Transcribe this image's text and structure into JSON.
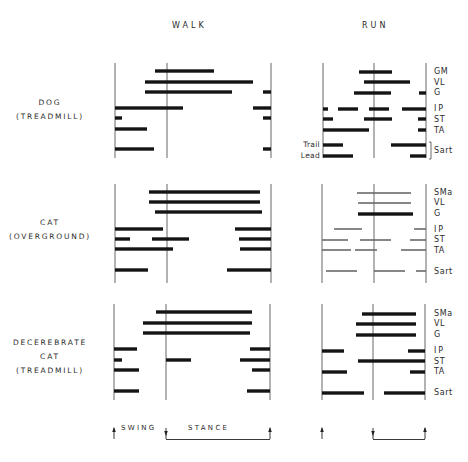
{
  "columns": {
    "walk": "WALK",
    "run": "RUN"
  },
  "groups": [
    {
      "line1": "DOG",
      "line2": "(TREADMILL)",
      "line3": ""
    },
    {
      "line1": "CAT",
      "line2": "(OVERGROUND)",
      "line3": ""
    },
    {
      "line1": "DECEREBRATE",
      "line2": "CAT",
      "line3": "(TREADMILL)"
    }
  ],
  "muscles": {
    "dog": [
      "GM",
      "VL",
      "G",
      "IP",
      "ST",
      "TA",
      "Sart"
    ],
    "cat": [
      "SMa",
      "VL",
      "G",
      "IP",
      "ST",
      "TA",
      "Sart"
    ],
    "decerebrate_cat": [
      "SMa",
      "VL",
      "G",
      "IP",
      "ST",
      "TA",
      "Sart"
    ]
  },
  "sart_sublabels": {
    "trail": "Trail",
    "lead": "Lead"
  },
  "legend": {
    "swing": "SWING",
    "stance": "STANCE"
  },
  "colors": {
    "bar": "#141414",
    "thin_bar": "#6a6a6a",
    "axis": "#555555"
  },
  "chart_data": {
    "type": "timing",
    "title": "",
    "xlabel": "Step cycle (swing | stance)",
    "columns": [
      "WALK",
      "RUN"
    ],
    "note": "Bars show EMG burst timing within one step cycle. x positions in pixels; walk panel axis lines at x=115 (swing onset), 167 (stance onset/foot contact), 271 (next swing onset); run panel at 323, 374, 426.",
    "panels": [
      {
        "group": "DOG (TREADMILL)",
        "gait": "WALK",
        "axes": {
          "x": [
            115,
            167,
            271
          ],
          "y": [
            63,
            158
          ]
        },
        "rows": [
          {
            "muscle": "GM",
            "y": 71,
            "bars": [
              [
                155,
                214
              ]
            ]
          },
          {
            "muscle": "VL",
            "y": 82,
            "bars": [
              [
                145,
                253
              ]
            ]
          },
          {
            "muscle": "G",
            "y": 92,
            "bars": [
              [
                145,
                232
              ],
              [
                263,
                271
              ]
            ]
          },
          {
            "muscle": "IP",
            "y": 108,
            "bars": [
              [
                115,
                183
              ],
              [
                253,
                271
              ]
            ]
          },
          {
            "muscle": "ST",
            "y": 118,
            "bars": [
              [
                115,
                122
              ],
              [
                263,
                271
              ]
            ]
          },
          {
            "muscle": "TA",
            "y": 129,
            "bars": [
              [
                115,
                147
              ]
            ]
          },
          {
            "muscle": "Sart",
            "y": 149,
            "bars": [
              [
                115,
                154
              ],
              [
                263,
                271
              ]
            ]
          }
        ]
      },
      {
        "group": "DOG (TREADMILL)",
        "gait": "RUN",
        "axes": {
          "x": [
            323,
            374,
            426
          ],
          "y": [
            63,
            158
          ]
        },
        "rows": [
          {
            "muscle": "GM",
            "y": 72,
            "bars": [
              [
                359,
                392
              ]
            ]
          },
          {
            "muscle": "VL",
            "y": 82,
            "bars": [
              [
                364,
                410
              ]
            ]
          },
          {
            "muscle": "G",
            "y": 93,
            "bars": [
              [
                354,
                391
              ],
              [
                419,
                426
              ]
            ]
          },
          {
            "muscle": "IP",
            "y": 109,
            "bars": [
              [
                323,
                328
              ],
              [
                338,
                358
              ],
              [
                369,
                389
              ],
              [
                402,
                426
              ]
            ]
          },
          {
            "muscle": "ST",
            "y": 119,
            "bars": [
              [
                323,
                333
              ],
              [
                364,
                392
              ],
              [
                418,
                426
              ]
            ]
          },
          {
            "muscle": "TA",
            "y": 130,
            "bars": [
              [
                323,
                369
              ],
              [
                418,
                426
              ]
            ]
          },
          {
            "muscle": "Sart Trail",
            "y": 145,
            "bars": [
              [
                323,
                343
              ],
              [
                391,
                426
              ]
            ]
          },
          {
            "muscle": "Sart Lead",
            "y": 156,
            "bars": [
              [
                323,
                353
              ],
              [
                410,
                426
              ]
            ]
          }
        ]
      },
      {
        "group": "CAT (OVERGROUND)",
        "gait": "WALK",
        "axes": {
          "x": [
            115,
            167,
            271
          ],
          "y": [
            184,
            283
          ]
        },
        "rows": [
          {
            "muscle": "SMa",
            "y": 192,
            "bars": [
              [
                149,
                260
              ]
            ]
          },
          {
            "muscle": "VL",
            "y": 202,
            "bars": [
              [
                149,
                260
              ]
            ]
          },
          {
            "muscle": "G",
            "y": 212,
            "bars": [
              [
                155,
                262
              ]
            ]
          },
          {
            "muscle": "IP",
            "y": 229,
            "bars": [
              [
                115,
                163
              ],
              [
                235,
                271
              ]
            ]
          },
          {
            "muscle": "ST",
            "y": 239,
            "bars": [
              [
                115,
                130
              ],
              [
                152,
                189
              ],
              [
                239,
                271
              ]
            ]
          },
          {
            "muscle": "TA",
            "y": 249,
            "bars": [
              [
                115,
                173
              ],
              [
                240,
                271
              ]
            ]
          },
          {
            "muscle": "Sart",
            "y": 270,
            "bars": [
              [
                115,
                148
              ],
              [
                227,
                271
              ]
            ]
          }
        ]
      },
      {
        "group": "CAT (OVERGROUND)",
        "gait": "RUN",
        "thin": true,
        "axes": {
          "x": [
            322,
            374,
            426
          ],
          "y": [
            184,
            283
          ]
        },
        "rows": [
          {
            "muscle": "SMa",
            "y": 193,
            "bars": [
              [
                357,
                411
              ]
            ]
          },
          {
            "muscle": "VL",
            "y": 203,
            "bars": [
              [
                358,
                411
              ]
            ]
          },
          {
            "muscle": "G",
            "y": 214,
            "bars": [
              [
                358,
                413
              ]
            ],
            "thick": true
          },
          {
            "muscle": "IP",
            "y": 229,
            "bars": [
              [
                334,
                362
              ],
              [
                414,
                426
              ]
            ]
          },
          {
            "muscle": "ST",
            "y": 240,
            "bars": [
              [
                322,
                348
              ],
              [
                360,
                391
              ],
              [
                410,
                426
              ]
            ]
          },
          {
            "muscle": "TA",
            "y": 250,
            "bars": [
              [
                322,
                351
              ],
              [
                355,
                377
              ],
              [
                401,
                426
              ]
            ]
          },
          {
            "muscle": "Sart",
            "y": 271,
            "bars": [
              [
                326,
                357
              ],
              [
                374,
                405
              ],
              [
                416,
                426
              ]
            ]
          }
        ]
      },
      {
        "group": "DECEREBRATE CAT (TREADMILL)",
        "gait": "WALK",
        "axes": {
          "x": [
            114,
            166,
            270
          ],
          "y": [
            304,
            400
          ]
        },
        "rows": [
          {
            "muscle": "SMa",
            "y": 312,
            "bars": [
              [
                156,
                252
              ]
            ]
          },
          {
            "muscle": "VL",
            "y": 323,
            "bars": [
              [
                143,
                252
              ]
            ]
          },
          {
            "muscle": "G",
            "y": 333,
            "bars": [
              [
                143,
                250
              ]
            ]
          },
          {
            "muscle": "IP",
            "y": 349,
            "bars": [
              [
                114,
                137
              ],
              [
                250,
                270
              ]
            ]
          },
          {
            "muscle": "ST",
            "y": 360,
            "bars": [
              [
                114,
                122
              ],
              [
                166,
                191
              ],
              [
                240,
                270
              ]
            ]
          },
          {
            "muscle": "TA",
            "y": 370,
            "bars": [
              [
                114,
                139
              ],
              [
                252,
                270
              ]
            ]
          },
          {
            "muscle": "Sart",
            "y": 391,
            "bars": [
              [
                114,
                139
              ],
              [
                247,
                270
              ]
            ]
          }
        ]
      },
      {
        "group": "DECEREBRATE CAT (TREADMILL)",
        "gait": "RUN",
        "axes": {
          "x": [
            322,
            373,
            425
          ],
          "y": [
            304,
            400
          ]
        },
        "rows": [
          {
            "muscle": "SMa",
            "y": 314,
            "bars": [
              [
                362,
                416
              ]
            ]
          },
          {
            "muscle": "VL",
            "y": 324,
            "bars": [
              [
                356,
                416
              ]
            ]
          },
          {
            "muscle": "G",
            "y": 335,
            "bars": [
              [
                356,
                416
              ]
            ]
          },
          {
            "muscle": "IP",
            "y": 351,
            "bars": [
              [
                322,
                344
              ],
              [
                408,
                425
              ]
            ]
          },
          {
            "muscle": "ST",
            "y": 361,
            "bars": [
              [
                358,
                425
              ]
            ]
          },
          {
            "muscle": "TA",
            "y": 372,
            "bars": [
              [
                322,
                347
              ],
              [
                410,
                425
              ]
            ]
          },
          {
            "muscle": "Sart",
            "y": 393,
            "bars": [
              [
                322,
                364
              ],
              [
                384,
                425
              ]
            ]
          }
        ]
      }
    ],
    "legend_markers": {
      "walk": {
        "swing_up_arrow_x": 114,
        "stance_down_arrow_x": 166,
        "end_up_arrow_x": 270,
        "bracket": [
          166,
          270
        ]
      },
      "run": {
        "swing_up_arrow_x": 322,
        "stance_down_arrow_x": 373,
        "end_up_arrow_x": 425,
        "bracket": [
          373,
          425
        ]
      }
    }
  }
}
